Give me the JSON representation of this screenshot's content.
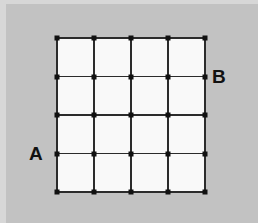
{
  "figure": {
    "kind": "grid-lattice-diagram",
    "canvas": {
      "width": 258,
      "height": 223
    },
    "colors": {
      "background": "#c2c2c2",
      "frame": "#d7d7d7",
      "grid_fill": "#f9f9f9",
      "line": "#2b2b2b",
      "node": "#111111",
      "label": "#111111"
    },
    "grid": {
      "columns": 4,
      "rows": 4,
      "node_columns": 5,
      "node_rows": 5,
      "node_count": 25,
      "left": 57,
      "top": 38,
      "width": 148,
      "height": 154,
      "cell_width": 37,
      "cell_height": 38.5,
      "x_positions": [
        0,
        37,
        74,
        111,
        148
      ],
      "y_positions": [
        0,
        38.5,
        77,
        115.5,
        154
      ]
    },
    "labels": [
      {
        "id": "a",
        "text": "A",
        "anchor_node": {
          "col": 0,
          "row": 3
        },
        "placement": "left-of-grid"
      },
      {
        "id": "b",
        "text": "B",
        "anchor_node": {
          "col": 4,
          "row": 1
        },
        "placement": "right-of-grid"
      }
    ]
  }
}
